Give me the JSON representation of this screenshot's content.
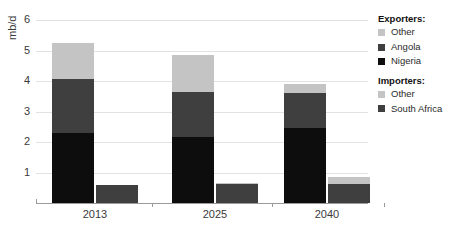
{
  "chart_data": {
    "type": "bar",
    "subtype": "stacked-column-grouped",
    "title": "",
    "xlabel": "",
    "ylabel": "mb/d",
    "categories": [
      "2013",
      "2025",
      "2040"
    ],
    "ylim": [
      0,
      6
    ],
    "yticks": [
      1,
      2,
      3,
      4,
      5,
      6
    ],
    "ytick_labels": [
      "1",
      "2",
      "3",
      "4",
      "5",
      "6"
    ],
    "grid": true,
    "grid_axis": "y",
    "legend_position": "right",
    "groups": [
      {
        "name": "Exporters",
        "series": [
          {
            "name": "Nigeria",
            "color": "#0d0d0d",
            "values": [
              2.3,
              2.15,
              2.45
            ]
          },
          {
            "name": "Angola",
            "color": "#3f3f3f",
            "values": [
              1.75,
              1.5,
              1.15
            ]
          },
          {
            "name": "Other",
            "color": "#c4c4c4",
            "values": [
              1.2,
              1.2,
              0.3
            ]
          }
        ],
        "totals": [
          5.25,
          4.85,
          3.9
        ]
      },
      {
        "name": "Importers",
        "series": [
          {
            "name": "South Africa",
            "color": "#3f3f3f",
            "values": [
              0.58,
              0.62,
              0.62
            ]
          },
          {
            "name": "Other",
            "color": "#c4c4c4",
            "values": [
              0.02,
              0.03,
              0.23
            ]
          }
        ],
        "totals": [
          0.6,
          0.65,
          0.85
        ]
      }
    ]
  },
  "axis": {
    "y_label": "mb/d",
    "y_ticks": [
      "6",
      "5",
      "4",
      "3",
      "2",
      "1"
    ],
    "x_ticks": [
      "2013",
      "2025",
      "2040"
    ]
  },
  "legend": {
    "exporters_heading": "Exporters:",
    "exporters_items": [
      {
        "label": "Other",
        "color": "#c4c4c4"
      },
      {
        "label": "Angola",
        "color": "#3f3f3f"
      },
      {
        "label": "Nigeria",
        "color": "#0d0d0d"
      }
    ],
    "importers_heading": "Importers:",
    "importers_items": [
      {
        "label": "Other",
        "color": "#c4c4c4"
      },
      {
        "label": "South Africa",
        "color": "#3f3f3f"
      }
    ]
  }
}
